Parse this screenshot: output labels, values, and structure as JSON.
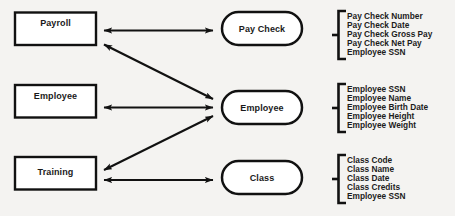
{
  "diagram": {
    "type": "entity-relationship-dataflow",
    "background_color": "#f4f3f1",
    "stroke_color": "#111111",
    "processes": [
      {
        "id": "payroll",
        "label": "Payroll"
      },
      {
        "id": "employee",
        "label": "Employee"
      },
      {
        "id": "training",
        "label": "Training"
      }
    ],
    "datastores": [
      {
        "id": "paycheck",
        "label": "Pay Check"
      },
      {
        "id": "employee_store",
        "label": "Employee"
      },
      {
        "id": "class",
        "label": "Class"
      }
    ],
    "attribute_groups": [
      {
        "id": "paycheck-attributes",
        "for": "paycheck",
        "attributes": [
          "Pay Check Number",
          "Pay Check Date",
          "Pay Check Gross Pay",
          "Pay Check Net Pay",
          "Employee SSN"
        ]
      },
      {
        "id": "employee-attributes",
        "for": "employee_store",
        "attributes": [
          "Employee SSN",
          "Employee Name",
          "Employee Birth Date",
          "Employee Height",
          "Employee Weight"
        ]
      },
      {
        "id": "class-attributes",
        "for": "class",
        "attributes": [
          "Class Code",
          "Class Name",
          "Class Date",
          "Class Credits",
          "Employee SSN"
        ]
      }
    ],
    "connections": [
      {
        "id": "payroll-paycheck",
        "from": "payroll",
        "to": "paycheck",
        "style": "double-arrow",
        "shape": "horizontal"
      },
      {
        "id": "payroll-employee-store",
        "from": "payroll",
        "to": "employee_store",
        "style": "double-arrow",
        "shape": "diagonal"
      },
      {
        "id": "employee-employee-store",
        "from": "employee",
        "to": "employee_store",
        "style": "double-arrow",
        "shape": "horizontal"
      },
      {
        "id": "training-employee-store",
        "from": "training",
        "to": "employee_store",
        "style": "double-arrow",
        "shape": "diagonal"
      },
      {
        "id": "training-class",
        "from": "training",
        "to": "class",
        "style": "double-arrow",
        "shape": "horizontal"
      }
    ]
  }
}
